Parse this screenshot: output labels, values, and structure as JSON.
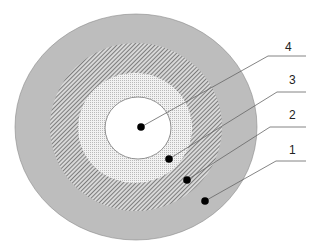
{
  "diagram": {
    "type": "concentric-layers",
    "colors": {
      "outer": "#bdbdbd",
      "hatched_bg": "#d8d8d8",
      "hatch_line": "#555555",
      "dotted_bg": "#f2f2f2",
      "dot_pattern": "#9a9a9a",
      "core": "#ffffff",
      "stroke": "#777777",
      "marker": "#000000",
      "leader": "#666666"
    },
    "layers": [
      {
        "id": 1,
        "label": "1",
        "fill": "solid-gray"
      },
      {
        "id": 2,
        "label": "2",
        "fill": "diagonal-hatch"
      },
      {
        "id": 3,
        "label": "3",
        "fill": "fine-dots"
      },
      {
        "id": 4,
        "label": "4",
        "fill": "white-core"
      }
    ],
    "labels": {
      "l1": "1",
      "l2": "2",
      "l3": "3",
      "l4": "4"
    }
  }
}
